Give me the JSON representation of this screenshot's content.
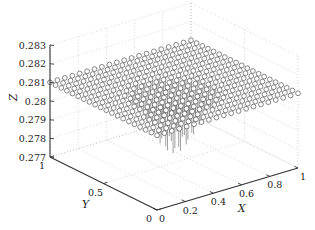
{
  "chart_data": {
    "type": "scatter3d_stem",
    "title": "",
    "xlabel": "X",
    "ylabel": "Y",
    "zlabel": "Z",
    "xlim": [
      0,
      1
    ],
    "ylim": [
      0,
      1
    ],
    "zlim": [
      0.277,
      0.283
    ],
    "xticks": [
      "0",
      "0.2",
      "0.4",
      "0.6",
      "0.8",
      "1"
    ],
    "yticks": [
      "0",
      "0.5",
      "1"
    ],
    "zticks": [
      "0.277",
      "0.278",
      "0.279",
      "0.28",
      "0.281",
      "0.282",
      "0.283"
    ],
    "grid": true,
    "grid_points_per_side": 20,
    "surface_z": 0.281,
    "dip_center": [
      0.5,
      0.5
    ],
    "dip_min_z": 0.2775,
    "marker": "open-circle",
    "stem_color": "#777777",
    "marker_edge_color": "#555555"
  }
}
